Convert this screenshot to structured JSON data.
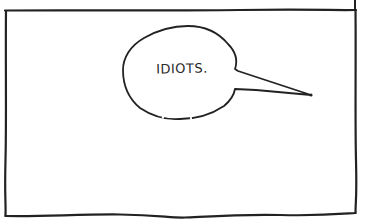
{
  "comic": {
    "panel": {
      "background": "#ffffff",
      "border_color": "#222222"
    },
    "speech_bubble": {
      "text": "IDIOTS."
    }
  }
}
